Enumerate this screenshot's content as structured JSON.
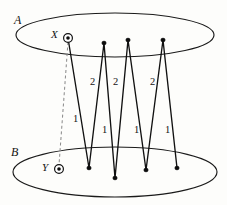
{
  "figure": {
    "background_color": "#fdfdfb",
    "stroke_color": "#111111",
    "dashed_color": "#8d8d8d",
    "width": 227,
    "height": 205
  },
  "sets": [
    {
      "id": "A",
      "label": "A",
      "label_x": 14,
      "label_y": 14,
      "cx": 115,
      "cy": 35,
      "rx": 99,
      "ry": 22
    },
    {
      "id": "B",
      "label": "B",
      "label_x": 11,
      "label_y": 146,
      "cx": 115,
      "cy": 172,
      "rx": 102,
      "ry": 25
    }
  ],
  "marked_points": [
    {
      "id": "X",
      "label": "X",
      "label_x": 51,
      "label_y": 29,
      "x": 68,
      "y": 38,
      "ring_r": 4.4,
      "core_r": 1.8
    },
    {
      "id": "Y",
      "label": "Y",
      "label_x": 42,
      "label_y": 162,
      "x": 59,
      "y": 169,
      "ring_r": 4.4,
      "core_r": 1.8
    }
  ],
  "zigzag": {
    "points": "68,38 89,168 104,43 115,178 128,40 146,170 163,40 177,168",
    "vertices": [
      {
        "name": "X",
        "x": 68,
        "y": 38,
        "set": "A",
        "dot": false
      },
      {
        "name": "b1",
        "x": 89,
        "y": 168,
        "set": "B",
        "dot": true
      },
      {
        "name": "a1",
        "x": 104,
        "y": 43,
        "set": "A",
        "dot": true
      },
      {
        "name": "b2",
        "x": 115,
        "y": 178,
        "set": "B",
        "dot": true
      },
      {
        "name": "a2",
        "x": 128,
        "y": 40,
        "set": "A",
        "dot": true
      },
      {
        "name": "b3",
        "x": 146,
        "y": 170,
        "set": "B",
        "dot": true
      },
      {
        "name": "a3",
        "x": 163,
        "y": 40,
        "set": "A",
        "dot": true
      },
      {
        "name": "b4",
        "x": 177,
        "y": 168,
        "set": "B",
        "dot": true
      }
    ]
  },
  "dashed_edge": {
    "from": "X",
    "to": "Y",
    "path": "M 68 42 L 59 165"
  },
  "edge_labels": [
    {
      "text": "1",
      "x": 73,
      "y": 114
    },
    {
      "text": "2",
      "x": 90,
      "y": 77
    },
    {
      "text": "1",
      "x": 102,
      "y": 125
    },
    {
      "text": "2",
      "x": 113,
      "y": 77
    },
    {
      "text": "1",
      "x": 134,
      "y": 125
    },
    {
      "text": "2",
      "x": 150,
      "y": 77
    },
    {
      "text": "1",
      "x": 165,
      "y": 125
    }
  ]
}
